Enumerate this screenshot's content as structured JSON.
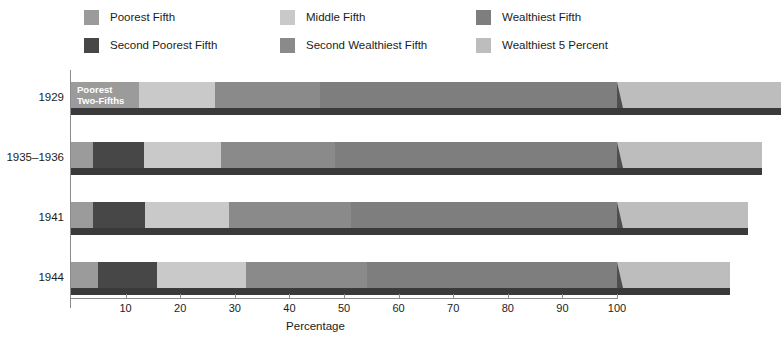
{
  "chart_data": {
    "type": "bar",
    "orientation": "horizontal",
    "stacked": true,
    "title": "",
    "xlabel": "Percentage",
    "ylabel": "",
    "xlim": [
      0,
      100
    ],
    "xticks": [
      10,
      20,
      30,
      40,
      50,
      60,
      70,
      80,
      90,
      100
    ],
    "xtick_labels": [
      "10",
      "20",
      "30",
      "40",
      "50",
      "60",
      "70",
      "80",
      "90",
      "100"
    ],
    "grid": false,
    "legend_position": "top",
    "categories": [
      "1929",
      "1935–1936",
      "1941",
      "1944"
    ],
    "series": [
      {
        "name": "Poorest Fifth",
        "color": "#9b9b9b",
        "values": [
          null,
          4.1,
          4.1,
          4.9
        ]
      },
      {
        "name": "Second Poorest Fifth",
        "color": "#474747",
        "values": [
          null,
          9.2,
          9.5,
          10.9
        ]
      },
      {
        "name": "Middle Fifth",
        "color": "#c9c9c9",
        "values": [
          13.8,
          14.1,
          15.3,
          16.2
        ]
      },
      {
        "name": "Second Wealthiest Fifth",
        "color": "#8a8a8a",
        "values": [
          19.3,
          20.9,
          22.3,
          22.2
        ]
      },
      {
        "name": "Wealthiest Fifth",
        "color": "#7e7e7e",
        "values": [
          54.4,
          51.7,
          48.8,
          45.8
        ]
      },
      {
        "name": "Wealthiest 5 Percent",
        "color": "#bdbdbd",
        "values": [
          30.0,
          26.5,
          24.0,
          20.7
        ]
      }
    ],
    "merged_segments": [
      {
        "category": "1929",
        "name": "Poorest Two-Fifths",
        "color": "#9b9b9b",
        "value": 12.5,
        "in_bar_label": "Poorest\nTwo-Fifths"
      }
    ]
  },
  "legend": {
    "items": [
      {
        "label": "Poorest Fifth",
        "color": "#9b9b9b",
        "row": 0,
        "col": 0,
        "icon": "legend-swatch-icon"
      },
      {
        "label": "Middle Fifth",
        "color": "#c9c9c9",
        "row": 0,
        "col": 1,
        "icon": "legend-swatch-icon"
      },
      {
        "label": "Wealthiest Fifth",
        "color": "#7e7e7e",
        "row": 0,
        "col": 2,
        "icon": "legend-swatch-icon"
      },
      {
        "label": "Second Poorest Fifth",
        "color": "#474747",
        "row": 1,
        "col": 0,
        "icon": "legend-swatch-icon"
      },
      {
        "label": "Second Wealthiest Fifth",
        "color": "#8a8a8a",
        "row": 1,
        "col": 1,
        "icon": "legend-swatch-icon"
      },
      {
        "label": "Wealthiest 5 Percent",
        "color": "#bdbdbd",
        "row": 1,
        "col": 2,
        "icon": "legend-swatch-icon"
      }
    ]
  },
  "axis": {
    "x_title": "Percentage",
    "tick_labels": [
      "10",
      "20",
      "30",
      "40",
      "50",
      "60",
      "70",
      "80",
      "90",
      "100"
    ],
    "year_labels": [
      "1929",
      "1935–1936",
      "1941",
      "1944"
    ]
  },
  "colors": {
    "axis_line": "#8c8c8c",
    "text": "#1c1c1c",
    "bar_shadow_dark": "#3a3a3a",
    "bar_shadow_mid": "#4e4e4e",
    "in_bar_label_text": "#ffffff",
    "background": "#ffffff"
  },
  "in_bar_labels": [
    {
      "category": "1929",
      "text": "Poorest\nTwo-Fifths"
    }
  ]
}
